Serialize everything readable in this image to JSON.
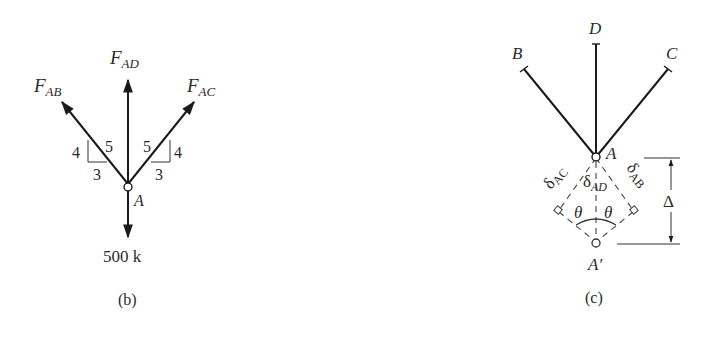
{
  "figure_b": {
    "caption": "(b)",
    "forces": {
      "ab": {
        "main": "F",
        "sub": "AB"
      },
      "ad": {
        "main": "F",
        "sub": "AD"
      },
      "ac": {
        "main": "F",
        "sub": "AC"
      }
    },
    "slope_left": {
      "rise": "4",
      "hyp": "5",
      "run": "3"
    },
    "slope_right": {
      "rise": "4",
      "hyp": "5",
      "run": "3"
    },
    "joint": "A",
    "load": "500 k"
  },
  "figure_c": {
    "caption": "(c)",
    "nodes": {
      "b": "B",
      "d": "D",
      "c": "C",
      "a": "A",
      "a_prime": "A′"
    },
    "deformations": {
      "ac": {
        "main": "δ",
        "sub": "AC"
      },
      "ad": {
        "main": "δ",
        "sub": "AD"
      },
      "ab": {
        "main": "δ",
        "sub": "AB"
      }
    },
    "angle_left": "θ",
    "angle_right": "θ",
    "displacement": "Δ"
  }
}
